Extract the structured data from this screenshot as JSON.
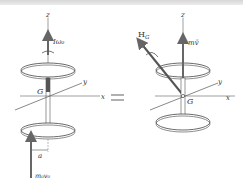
{
  "figure": {
    "left": {
      "axis_z": "z",
      "axis_y": "y",
      "axis_x": "x",
      "center_label": "G",
      "angular_momentum_label": "Iω₀",
      "impulse_label": "m₀v₀",
      "offset_label": "a"
    },
    "equals_sign": "=",
    "right": {
      "axis_z": "z",
      "axis_y": "y",
      "axis_x": "x",
      "center_label": "G",
      "angular_momentum_label": "H",
      "angular_momentum_subscript": "G",
      "linear_momentum_label": "mv̄"
    },
    "colors": {
      "line": "#555555",
      "arrow": "#6a6a6a",
      "disc": "#444444",
      "equals": "#b0b0b0",
      "top_band": "#d8d8d8"
    }
  }
}
